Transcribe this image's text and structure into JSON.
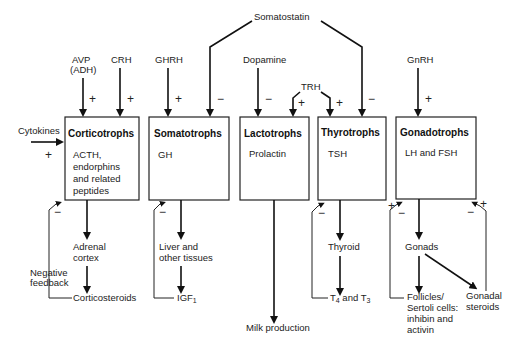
{
  "diagram": {
    "regulators": {
      "somatostatin": "Somatostatin",
      "avp_line1": "AVP",
      "avp_line2": "(ADH)",
      "crh": "CRH",
      "ghrh": "GHRH",
      "dopamine": "Dopamine",
      "trh": "TRH",
      "gnrh": "GnRH",
      "cytokines": "Cytokines"
    },
    "cells": [
      {
        "name": "Corticotrophs",
        "products": [
          "ACTH,",
          "endorphins",
          "and related",
          "peptides"
        ]
      },
      {
        "name": "Somatotrophs",
        "products": [
          "GH"
        ]
      },
      {
        "name": "Lactotrophs",
        "products": [
          "Prolactin"
        ]
      },
      {
        "name": "Thyrotrophs",
        "products": [
          "TSH"
        ]
      },
      {
        "name": "Gonadotrophs",
        "products": [
          "LH and FSH"
        ]
      }
    ],
    "targets": {
      "adrenal_1": "Adrenal",
      "adrenal_2": "cortex",
      "corticosteroids": "Corticosteroids",
      "negative_1": "Negative",
      "negative_2": "feedback",
      "liver_1": "Liver and",
      "liver_2": "other tissues",
      "igf": "IGF",
      "igf_sub": "1",
      "milk": "Milk production",
      "thyroid": "Thyroid",
      "t_a": "T",
      "t_a_sub": "4",
      "t_mid": " and T",
      "t_b_sub": "3",
      "gonads": "Gonads",
      "follicles_1": "Follicles/",
      "follicles_2": "Sertoli cells:",
      "follicles_3": "inhibin and",
      "follicles_4": "activin",
      "gonadal_1": "Gonadal",
      "gonadal_2": "steroids"
    },
    "signs": {
      "plus": "+",
      "minus": "−"
    }
  }
}
